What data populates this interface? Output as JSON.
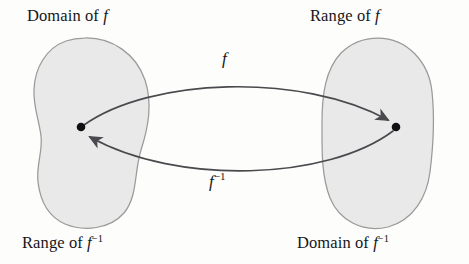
{
  "figure": {
    "kind": "function-inverse-mapping-diagram",
    "background_color": "#fdfdfc",
    "set_fill_color": "#e9e9e9",
    "set_stroke_color": "#9a9a9a",
    "curve_color": "#4a4a4e",
    "point_color": "#101014",
    "text_color": "#15161a"
  },
  "labels": {
    "domain_f": {
      "text": "Domain of ",
      "symbol": "f",
      "exponent": ""
    },
    "range_f": {
      "text": "Range of ",
      "symbol": "f",
      "exponent": ""
    },
    "range_f_inverse": {
      "text": "Range of ",
      "symbol": "f",
      "exponent": "−1"
    },
    "domain_f_inverse": {
      "text": "Domain of ",
      "symbol": "f",
      "exponent": "−1"
    }
  },
  "arrows": {
    "forward": {
      "symbol": "f",
      "exponent": "",
      "direction": "left-to-right"
    },
    "inverse": {
      "symbol": "f",
      "exponent": "−1",
      "direction": "right-to-left"
    }
  },
  "sets": {
    "left": {
      "name": "domain-of-f-set",
      "center_x": 90,
      "center_y": 133
    },
    "right": {
      "name": "range-of-f-set",
      "center_x": 377,
      "center_y": 133
    }
  },
  "points": {
    "left_point": {
      "x": 81,
      "y": 127
    },
    "right_point": {
      "x": 396,
      "y": 127
    }
  }
}
